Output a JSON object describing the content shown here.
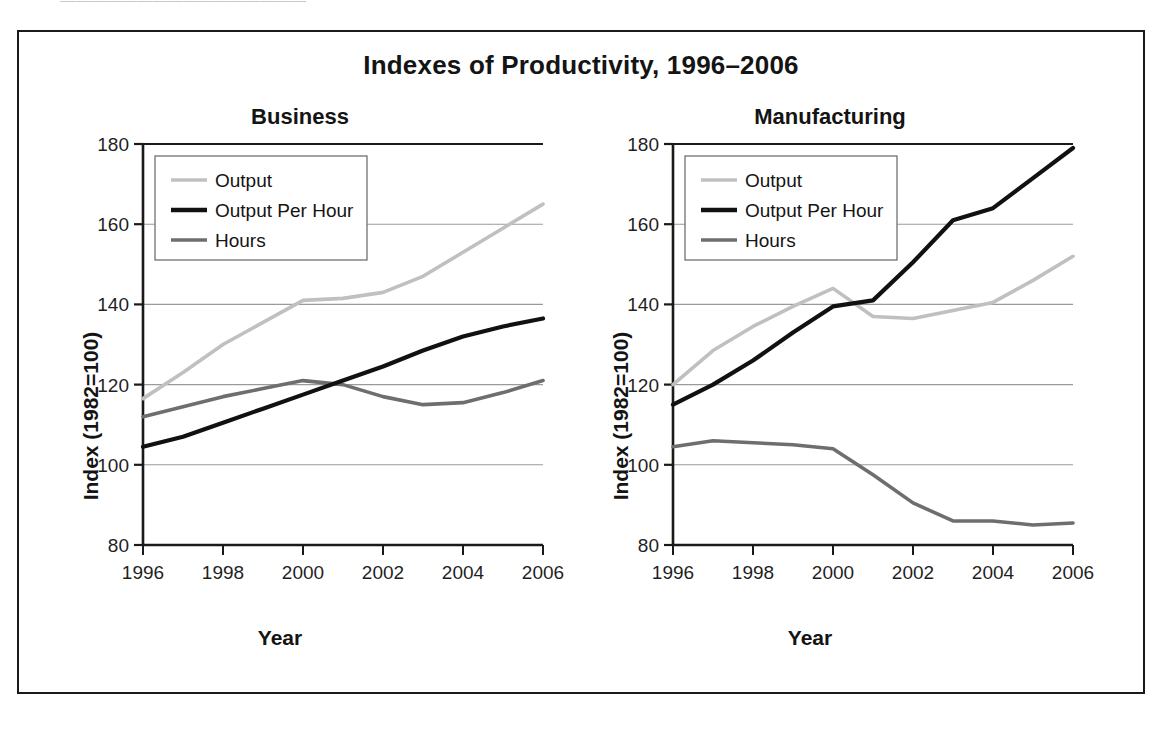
{
  "figure": {
    "title": "Indexes of Productivity, 1996–2006",
    "top_clipped_text": "————————————————",
    "frame_color": "#1a1a1a",
    "background": "#ffffff"
  },
  "colors": {
    "output": "#c0c0c0",
    "output_per_hour": "#111111",
    "hours": "#6e6e6e",
    "gridline": "#9a9a9a",
    "axis": "#1a1a1a",
    "text": "#141414"
  },
  "axis": {
    "ylabel": "Index (1982=100)",
    "xlabel": "Year",
    "yticks": [
      "80",
      "100",
      "120",
      "140",
      "160",
      "180"
    ],
    "xticks": [
      "1996",
      "1998",
      "2000",
      "2002",
      "2004",
      "2006"
    ],
    "ylim": [
      80,
      180
    ],
    "xlim": [
      1996,
      2006
    ]
  },
  "legend": {
    "items": [
      {
        "label": "Output",
        "color": "#c0c0c0"
      },
      {
        "label": "Output Per Hour",
        "color": "#111111"
      },
      {
        "label": "Hours",
        "color": "#6e6e6e"
      }
    ]
  },
  "chart_data": [
    {
      "type": "line",
      "title": "Business",
      "xlabel": "Year",
      "ylabel": "Index (1982=100)",
      "ylim": [
        80,
        180
      ],
      "xlim": [
        1996,
        2006
      ],
      "grid": true,
      "legend_position": "upper-left",
      "x": [
        1996,
        1997,
        1998,
        1999,
        2000,
        2001,
        2002,
        2003,
        2004,
        2005,
        2006
      ],
      "series": [
        {
          "name": "Output",
          "color": "#c0c0c0",
          "values": [
            116.5,
            123.0,
            130.0,
            135.5,
            141.0,
            141.5,
            143.0,
            147.0,
            153.0,
            159.0,
            165.0
          ]
        },
        {
          "name": "Output Per Hour",
          "color": "#111111",
          "values": [
            104.5,
            107.0,
            110.5,
            114.0,
            117.5,
            121.0,
            124.5,
            128.5,
            132.0,
            134.5,
            136.5
          ]
        },
        {
          "name": "Hours",
          "color": "#6e6e6e",
          "values": [
            112.0,
            114.5,
            117.0,
            119.0,
            121.0,
            120.0,
            117.0,
            115.0,
            115.5,
            118.0,
            121.0
          ]
        }
      ]
    },
    {
      "type": "line",
      "title": "Manufacturing",
      "xlabel": "Year",
      "ylabel": "Index (1982=100)",
      "ylim": [
        80,
        180
      ],
      "xlim": [
        1996,
        2006
      ],
      "grid": true,
      "legend_position": "upper-left",
      "x": [
        1996,
        1997,
        1998,
        1999,
        2000,
        2001,
        2002,
        2003,
        2004,
        2005,
        2006
      ],
      "series": [
        {
          "name": "Output",
          "color": "#c0c0c0",
          "values": [
            120.0,
            128.5,
            134.5,
            139.5,
            144.0,
            137.0,
            136.5,
            138.5,
            140.5,
            146.0,
            152.0
          ]
        },
        {
          "name": "Output Per Hour",
          "color": "#111111",
          "values": [
            115.0,
            120.0,
            126.0,
            133.0,
            139.5,
            141.0,
            150.5,
            161.0,
            164.0,
            171.5,
            179.0
          ]
        },
        {
          "name": "Hours",
          "color": "#6e6e6e",
          "values": [
            104.5,
            106.0,
            105.5,
            105.0,
            104.0,
            97.5,
            90.5,
            86.0,
            86.0,
            85.0,
            85.5
          ]
        }
      ]
    }
  ]
}
